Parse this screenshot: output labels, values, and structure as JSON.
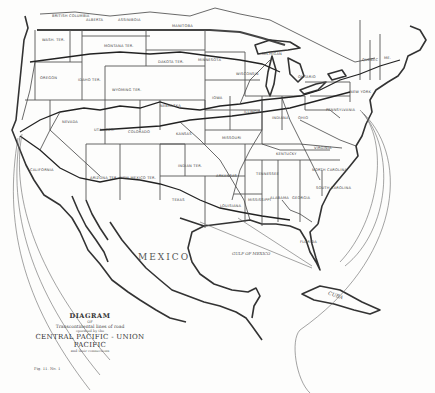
{
  "map": {
    "title": "DIAGRAM",
    "subtitle_connector": "OF",
    "subtitle": "Transcontinental lines of road",
    "subtitle_small": "operated by the",
    "railroad_name": "CENTRAL PACIFIC - UNION PACIFIC",
    "railroad_note": "and their connections",
    "plate_number": "Fig. 11. No. 1",
    "country_labels": {
      "mexico": "MEXICO.",
      "cuba": "CUBA",
      "gulf": "GULF OF MEXICO",
      "british_columbia": "BRITISH COLUMBIA",
      "alberta": "ALBERTA",
      "assiniboia": "ASSINIBOIA",
      "manitoba": "MANITOBA",
      "ontario": "ONTARIO",
      "quebec": "QUEBEC"
    },
    "state_labels": {
      "wash": "WASH. TER.",
      "oregon": "OREGON",
      "idaho": "IDAHO TER.",
      "montana": "MONTANA TER.",
      "dakota": "DAKOTA TER.",
      "minnesota": "MINNESOTA",
      "wisconsin": "WISCONSIN",
      "michigan": "MICHIGAN",
      "wyoming": "WYOMING TER.",
      "nebraska": "NEBRASKA",
      "iowa": "IOWA",
      "illinois": "ILLINOIS",
      "indiana": "INDIANA",
      "ohio": "OHIO",
      "pennsylvania": "PENNSYLVANIA",
      "new_york": "NEW YORK",
      "nevada": "NEVADA",
      "utah": "UTAH TER.",
      "colorado": "COLORADO",
      "kansas": "KANSAS",
      "missouri": "MISSOURI",
      "kentucky": "KENTUCKY",
      "virginia": "VIRGINIA",
      "california": "CALIFORNIA",
      "arizona": "ARIZONA TER.",
      "new_mexico": "NEW MEXICO TER.",
      "indian_ter": "INDIAN TER.",
      "arkansas": "ARKANSAS",
      "tennessee": "TENNESSEE",
      "north_carolina": "NORTH CAROLINA",
      "south_carolina": "SOUTH CAROLINA",
      "mississippi": "MISSISSIPPI",
      "alabama": "ALABAMA",
      "georgia": "GEORGIA",
      "louisiana": "LOUISIANA",
      "texas": "TEXAS",
      "florida": "FLORIDA",
      "maine": "ME."
    },
    "colors": {
      "ink": "#333333",
      "paper": "#fdfdfc"
    }
  }
}
